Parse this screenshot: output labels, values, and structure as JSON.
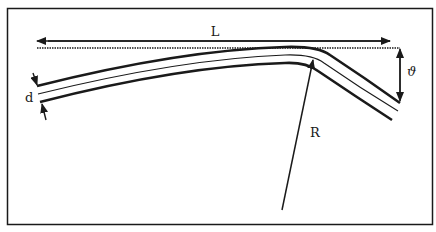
{
  "diagram": {
    "type": "bent-strip-geometry",
    "labels": {
      "length": "L",
      "thickness": "d",
      "radius": "R",
      "deflection": "ϑ"
    },
    "colors": {
      "ink": "#1a1a1a",
      "background": "#ffffff"
    }
  }
}
